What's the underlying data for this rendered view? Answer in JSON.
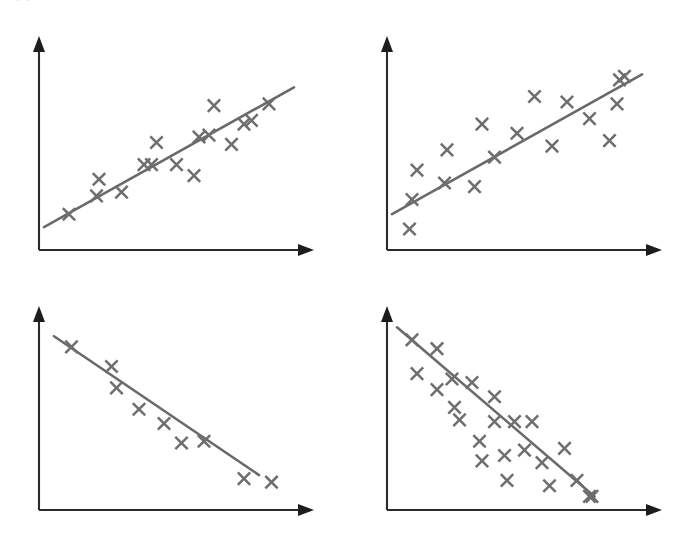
{
  "figure": {
    "clipped_caption": "+ 0 0 ++++++ ++ +++++",
    "background_color": "#ffffff",
    "marker_color": "#6e6e6e",
    "line_color": "#6a6a6a",
    "axis_color": "#2b2b2b",
    "marker_glyph": "x-cross",
    "width": 693,
    "height": 538
  },
  "chart_data": [
    {
      "id": "top-left",
      "type": "scatter",
      "title": "",
      "xlabel": "",
      "ylabel": "",
      "grid": false,
      "legend": false,
      "correlation": "strong positive",
      "xlim": [
        0,
        100
      ],
      "ylim": [
        0,
        100
      ],
      "points": [
        {
          "x": 10,
          "y": 14
        },
        {
          "x": 21,
          "y": 24
        },
        {
          "x": 22,
          "y": 33
        },
        {
          "x": 31,
          "y": 26
        },
        {
          "x": 40,
          "y": 41
        },
        {
          "x": 43,
          "y": 41
        },
        {
          "x": 45,
          "y": 53
        },
        {
          "x": 53,
          "y": 41
        },
        {
          "x": 60,
          "y": 35
        },
        {
          "x": 62,
          "y": 56
        },
        {
          "x": 66,
          "y": 57
        },
        {
          "x": 68,
          "y": 73
        },
        {
          "x": 75,
          "y": 52
        },
        {
          "x": 80,
          "y": 63
        },
        {
          "x": 83,
          "y": 65
        },
        {
          "x": 90,
          "y": 74
        }
      ],
      "fit_line": {
        "x0": 0,
        "y0": 7,
        "x1": 100,
        "y1": 83
      }
    },
    {
      "id": "top-right",
      "type": "scatter",
      "title": "",
      "xlabel": "",
      "ylabel": "",
      "grid": false,
      "legend": false,
      "correlation": "moderate positive",
      "xlim": [
        0,
        100
      ],
      "ylim": [
        0,
        100
      ],
      "points": [
        {
          "x": 7,
          "y": 6
        },
        {
          "x": 8,
          "y": 22
        },
        {
          "x": 10,
          "y": 38
        },
        {
          "x": 21,
          "y": 31
        },
        {
          "x": 22,
          "y": 49
        },
        {
          "x": 33,
          "y": 29
        },
        {
          "x": 36,
          "y": 63
        },
        {
          "x": 41,
          "y": 45
        },
        {
          "x": 50,
          "y": 58
        },
        {
          "x": 57,
          "y": 78
        },
        {
          "x": 64,
          "y": 51
        },
        {
          "x": 70,
          "y": 75
        },
        {
          "x": 79,
          "y": 66
        },
        {
          "x": 87,
          "y": 54
        },
        {
          "x": 90,
          "y": 74
        },
        {
          "x": 91,
          "y": 87
        },
        {
          "x": 93,
          "y": 89
        }
      ],
      "fit_line": {
        "x0": 0,
        "y0": 14,
        "x1": 100,
        "y1": 90
      }
    },
    {
      "id": "bottom-left",
      "type": "scatter",
      "title": "",
      "xlabel": "",
      "ylabel": "",
      "grid": false,
      "legend": false,
      "correlation": "strong negative",
      "xlim": [
        0,
        100
      ],
      "ylim": [
        0,
        100
      ],
      "points": [
        {
          "x": 11,
          "y": 86
        },
        {
          "x": 27,
          "y": 75
        },
        {
          "x": 29,
          "y": 63
        },
        {
          "x": 38,
          "y": 51
        },
        {
          "x": 48,
          "y": 43
        },
        {
          "x": 55,
          "y": 32
        },
        {
          "x": 64,
          "y": 33
        },
        {
          "x": 80,
          "y": 12
        },
        {
          "x": 91,
          "y": 10
        }
      ],
      "fit_line": {
        "x0": 4,
        "y0": 92,
        "x1": 86,
        "y1": 14
      }
    },
    {
      "id": "bottom-right",
      "type": "scatter",
      "title": "",
      "xlabel": "",
      "ylabel": "",
      "grid": false,
      "legend": false,
      "correlation": "moderate negative",
      "xlim": [
        0,
        100
      ],
      "ylim": [
        0,
        100
      ],
      "points": [
        {
          "x": 8,
          "y": 90
        },
        {
          "x": 10,
          "y": 71
        },
        {
          "x": 18,
          "y": 85
        },
        {
          "x": 18,
          "y": 62
        },
        {
          "x": 24,
          "y": 68
        },
        {
          "x": 25,
          "y": 52
        },
        {
          "x": 27,
          "y": 45
        },
        {
          "x": 32,
          "y": 66
        },
        {
          "x": 35,
          "y": 33
        },
        {
          "x": 36,
          "y": 22
        },
        {
          "x": 41,
          "y": 58
        },
        {
          "x": 41,
          "y": 44
        },
        {
          "x": 45,
          "y": 25
        },
        {
          "x": 46,
          "y": 11
        },
        {
          "x": 49,
          "y": 44
        },
        {
          "x": 53,
          "y": 28
        },
        {
          "x": 56,
          "y": 44
        },
        {
          "x": 60,
          "y": 21
        },
        {
          "x": 63,
          "y": 8
        },
        {
          "x": 69,
          "y": 29
        },
        {
          "x": 74,
          "y": 11
        },
        {
          "x": 79,
          "y": 2
        },
        {
          "x": 80,
          "y": 2
        }
      ],
      "fit_line": {
        "x0": 2,
        "y0": 97,
        "x1": 81,
        "y1": 2
      }
    }
  ]
}
